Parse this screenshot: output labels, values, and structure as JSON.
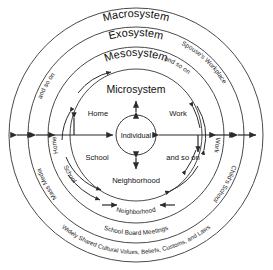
{
  "diagram": {
    "type": "concentric-circles",
    "background_color": "#ffffff",
    "stroke_color": "#4a4a4a",
    "center": {
      "x": 136,
      "y": 135
    },
    "rings": [
      {
        "name": "macrosystem",
        "label": "Macrosystem",
        "radius": 127
      },
      {
        "name": "exosystem",
        "label": "Exosystem",
        "radius": 108
      },
      {
        "name": "mesosystem",
        "label": "Mesosystem",
        "radius": 88
      },
      {
        "name": "microsystem",
        "label": "Microsystem",
        "radius": 66
      },
      {
        "name": "individual",
        "label": "Individual",
        "radius": 20
      }
    ],
    "microsystem_nodes": [
      {
        "name": "home",
        "label": "Home"
      },
      {
        "name": "work",
        "label": "Work"
      },
      {
        "name": "school",
        "label": "School"
      },
      {
        "name": "and-so-on",
        "label": "and so on"
      },
      {
        "name": "neighborhood",
        "label": "Neighborhood"
      }
    ],
    "mesosystem_labels": [
      {
        "name": "meso-home",
        "label": "Home"
      },
      {
        "name": "meso-school",
        "label": "School"
      },
      {
        "name": "meso-neighborhood",
        "label": "Neighborhood"
      },
      {
        "name": "meso-work",
        "label": "Work"
      },
      {
        "name": "meso-and-so-on",
        "label": "and so on"
      }
    ],
    "exosystem_labels": [
      {
        "name": "exo-spouses-workplace",
        "label": "Spouse's Workplace"
      },
      {
        "name": "exo-childs-school",
        "label": "Child's School"
      },
      {
        "name": "exo-school-board-meetings",
        "label": "School Board Meetings"
      },
      {
        "name": "exo-mass-media",
        "label": "Mass Media"
      },
      {
        "name": "exo-and-so-on",
        "label": "and so on"
      }
    ],
    "macrosystem_labels": [
      {
        "name": "macro-values",
        "label": "Widely Shared Cultural Values, Beliefs, Customs, and Laws"
      }
    ]
  }
}
